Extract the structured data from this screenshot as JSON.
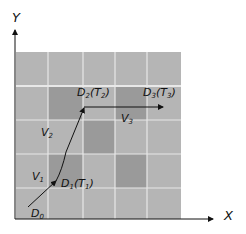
{
  "diagram": {
    "axes": {
      "x_label": "X",
      "y_label": "Y"
    },
    "grid": {
      "rows": 5,
      "cols": 5,
      "light_color": "#b5b5b5",
      "dark_color": "#9a9a9a",
      "line_color": "#e6e6e6",
      "dark_cells": [
        [
          1,
          1
        ],
        [
          1,
          3
        ],
        [
          2,
          2
        ],
        [
          3,
          1
        ],
        [
          3,
          3
        ]
      ]
    },
    "points": [
      {
        "name": "D",
        "sub": "0",
        "time": ""
      },
      {
        "name": "D",
        "sub": "1",
        "time": "T",
        "time_sub": "1"
      },
      {
        "name": "D",
        "sub": "2",
        "time": "T",
        "time_sub": "2"
      },
      {
        "name": "D",
        "sub": "3",
        "time": "T",
        "time_sub": "3"
      }
    ],
    "vectors": [
      {
        "name": "V",
        "sub": "1"
      },
      {
        "name": "V",
        "sub": "2"
      },
      {
        "name": "V",
        "sub": "3"
      }
    ]
  }
}
